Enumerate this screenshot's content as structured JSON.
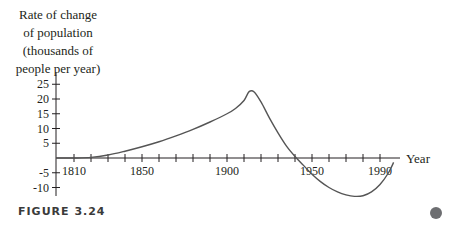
{
  "chart_data": {
    "type": "line",
    "title": "",
    "ylabel_lines": [
      "Rate of change",
      "of population",
      "(thousands of",
      "people per year)"
    ],
    "xlabel": "Year",
    "x_tick_labels": [
      "1810",
      "1850",
      "1900",
      "1950",
      "1990"
    ],
    "x_tick_values": [
      1810,
      1850,
      1900,
      1950,
      1990
    ],
    "x_minor_tick_step": 10,
    "y_tick_labels": [
      "25",
      "20",
      "15",
      "10",
      "5",
      "-5",
      "-10"
    ],
    "y_tick_values": [
      25,
      20,
      15,
      10,
      5,
      -5,
      -10
    ],
    "xlim": [
      1800,
      2000
    ],
    "ylim": [
      -12,
      28
    ],
    "grid": false,
    "series": [
      {
        "name": "Rate of change of population",
        "x": [
          1800,
          1810,
          1820,
          1830,
          1840,
          1850,
          1860,
          1870,
          1880,
          1890,
          1900,
          1905,
          1910,
          1913,
          1916,
          1920,
          1925,
          1930,
          1935,
          1940,
          1945,
          1950,
          1955,
          1960,
          1965,
          1970,
          1975,
          1980,
          1985,
          1990,
          1995,
          1998
        ],
        "y": [
          0,
          0,
          0.2,
          1,
          2.3,
          3.8,
          5.5,
          7.5,
          9.7,
          12.2,
          15,
          16.8,
          19.5,
          22.5,
          22.4,
          19,
          13.5,
          8.5,
          4,
          0.5,
          -2.5,
          -5.5,
          -8,
          -10,
          -11.5,
          -12.5,
          -13,
          -12.8,
          -11.5,
          -9,
          -5,
          -1.5
        ]
      }
    ]
  },
  "caption": "FIGURE 3.24",
  "colors": {
    "axis": "#231f20",
    "curve": "#555555",
    "dot": "#6d6e71"
  }
}
